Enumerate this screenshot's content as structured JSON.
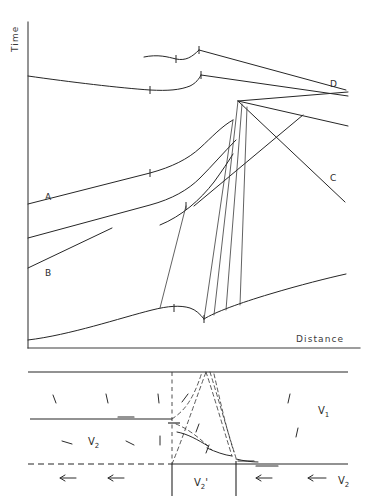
{
  "figure": {
    "background_color": "#ffffff",
    "line_color": "#262626"
  },
  "upper_panel": {
    "name": "travel-time-diagram",
    "axes": {
      "y_label": "Time",
      "x_label": "Distance",
      "y_axis_x": 28,
      "y_axis_top": 22,
      "y_axis_bottom": 348,
      "x_axis_y": 348,
      "x_axis_left": 28,
      "x_axis_right": 360
    },
    "branch_labels": [
      {
        "id": "A",
        "label": "A",
        "x": 45,
        "y": 200
      },
      {
        "id": "B",
        "label": "B",
        "x": 45,
        "y": 273
      },
      {
        "id": "C",
        "label": "C",
        "x": 330,
        "y": 178
      },
      {
        "id": "D",
        "label": "D",
        "x": 330,
        "y": 84
      }
    ]
  },
  "lower_panel": {
    "name": "velocity-model-diagram",
    "layer_labels": [
      {
        "id": "v1",
        "base": "V",
        "sub": "1",
        "x": 322,
        "y": 412
      },
      {
        "id": "v2-left",
        "base": "V",
        "sub": "2",
        "x": 93,
        "y": 443
      },
      {
        "id": "v2-prime",
        "base": "V",
        "sub": "2",
        "prime": "'",
        "x": 199,
        "y": 484
      },
      {
        "id": "v2-right",
        "base": "V",
        "sub": "2",
        "x": 343,
        "y": 484
      }
    ],
    "interfaces": {
      "surface_y": 372,
      "mid_y": 419,
      "base_y": 464,
      "left_x": 28,
      "right_x": 348,
      "step_x": 172,
      "step2_x": 236
    }
  }
}
